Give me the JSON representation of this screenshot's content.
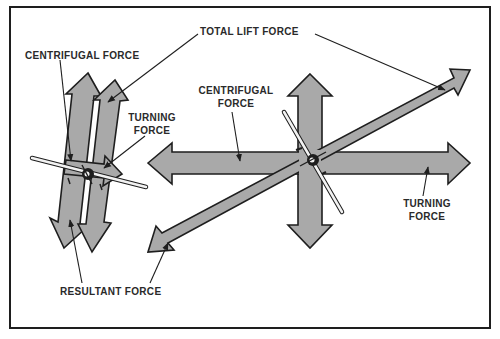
{
  "figure": {
    "frame_color": "#1e1e1e",
    "arrow_fill": "#a9a9a9",
    "left_diagram": {
      "labels": {
        "centrifugal": "CENTRIFUGAL FORCE",
        "turning_line1": "TURNING",
        "turning_line2": "FORCE",
        "resultant": "RESULTANT FORCE"
      }
    },
    "right_diagram": {
      "labels": {
        "centrifugal_line1": "CENTRIFUGAL",
        "centrifugal_line2": "FORCE",
        "turning_line1": "TURNING",
        "turning_line2": "FORCE"
      }
    },
    "shared_labels": {
      "total_lift": "TOTAL LIFT FORCE",
      "resultant": "RESULTANT FORCE"
    }
  }
}
